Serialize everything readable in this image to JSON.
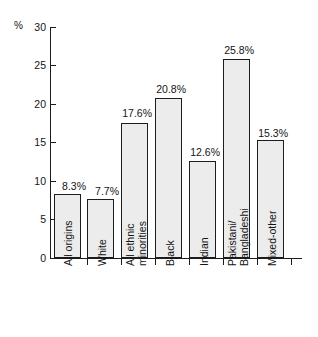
{
  "chart_data": {
    "type": "bar",
    "title": "",
    "subtitle": "",
    "xlabel": "",
    "ylabel": "%",
    "ylim": [
      0,
      30
    ],
    "ytick_values": [
      0,
      5,
      10,
      15,
      20,
      25,
      30
    ],
    "ytick_labels": [
      "0",
      "5",
      "10",
      "15",
      "20",
      "25",
      "30"
    ],
    "grid": false,
    "legend": null,
    "categories": [
      "All origins",
      "White",
      "All ethnic minorities",
      "Black",
      "Indian",
      "Pakistani/Bangladeshi",
      "Mixed-other"
    ],
    "category_lines": [
      [
        "All origins"
      ],
      [
        "White"
      ],
      [
        "All ethnic",
        "minorities"
      ],
      [
        "Black"
      ],
      [
        "Indian"
      ],
      [
        "Pakistani/",
        "Bangladeshi"
      ],
      [
        "Mixed-other"
      ]
    ],
    "values": [
      8.3,
      7.7,
      17.6,
      20.8,
      12.6,
      25.8,
      15.3
    ],
    "value_labels": [
      "8.3%",
      "7.7%",
      "17.6%",
      "20.8%",
      "12.6%",
      "25.8%",
      "15.3%"
    ],
    "colors": {
      "bar_fill": "#ececec",
      "bar_stroke": "#1d1d1d",
      "axis": "#1c1c1c",
      "text": "#141414",
      "background": "#ffffff"
    }
  }
}
